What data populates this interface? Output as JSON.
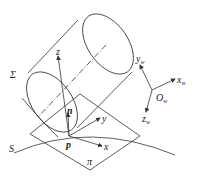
{
  "diagram": {
    "labels": {
      "sigma": "Σ",
      "z": "z",
      "n": "n",
      "y": "y",
      "x": "x",
      "p": "p",
      "S": "S",
      "pi": "π",
      "yw": "y",
      "xw": "x",
      "zw": "z",
      "Ow": "O",
      "w_sub": "w"
    },
    "colors": {
      "line": "#333333",
      "background": "#ffffff"
    }
  }
}
